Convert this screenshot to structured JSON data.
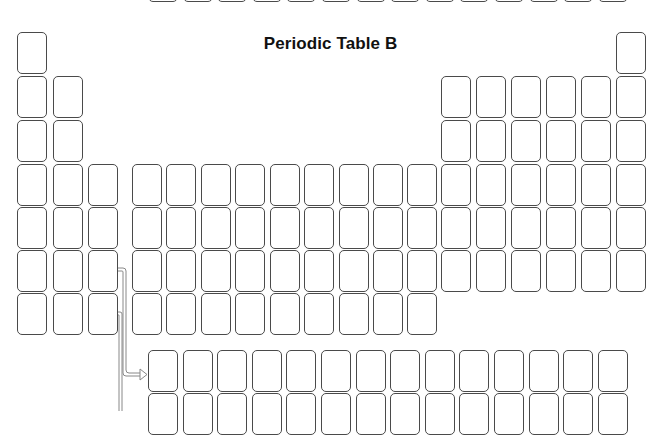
{
  "title": "Periodic Table B",
  "colors": {
    "cell_border": "#4a4a4a",
    "background": "#ffffff",
    "title": "#111111",
    "arrow": "#888888"
  },
  "layout": {
    "columns_x": [
      17,
      53,
      88,
      132,
      166,
      201,
      235,
      270,
      304,
      339,
      373,
      407,
      441,
      476,
      511,
      546,
      581,
      616
    ],
    "rows_y": [
      32,
      76,
      120,
      164,
      207,
      250,
      293
    ],
    "f_block_x_start": 148,
    "f_block_pitch": 34.6,
    "f_block_count": 14,
    "lanthanide_row_y": 350,
    "actinide_row_y": 393,
    "prev_table_partial_row_y": -40
  },
  "periodic_table": {
    "rows": [
      {
        "period": 1,
        "columns": [
          1,
          18
        ]
      },
      {
        "period": 2,
        "columns": [
          1,
          2,
          13,
          14,
          15,
          16,
          17,
          18
        ]
      },
      {
        "period": 3,
        "columns": [
          1,
          2,
          13,
          14,
          15,
          16,
          17,
          18
        ]
      },
      {
        "period": 4,
        "columns": [
          1,
          2,
          3,
          4,
          5,
          6,
          7,
          8,
          9,
          10,
          11,
          12,
          13,
          14,
          15,
          16,
          17,
          18
        ]
      },
      {
        "period": 5,
        "columns": [
          1,
          2,
          3,
          4,
          5,
          6,
          7,
          8,
          9,
          10,
          11,
          12,
          13,
          14,
          15,
          16,
          17,
          18
        ]
      },
      {
        "period": 6,
        "columns": [
          1,
          2,
          3,
          4,
          5,
          6,
          7,
          8,
          9,
          10,
          11,
          12,
          13,
          14,
          15,
          16,
          17,
          18
        ]
      },
      {
        "period": 7,
        "columns": [
          1,
          2,
          3,
          4,
          5,
          6,
          7,
          8,
          9,
          10,
          11,
          12
        ]
      }
    ],
    "f_block_rows": [
      {
        "name": "lanthanides",
        "count": 14
      },
      {
        "name": "actinides",
        "count": 14
      }
    ],
    "cells_labeled": false
  }
}
